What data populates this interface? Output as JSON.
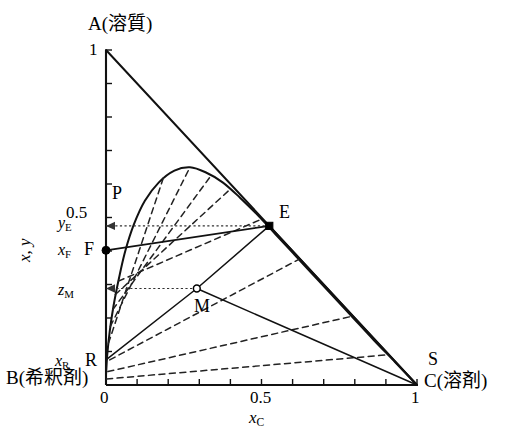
{
  "figure": {
    "kind": "ternary-phase-diagram",
    "vertices": {
      "top_label": "A(溶質)",
      "bottom_left_label": "B(希釈剤)",
      "bottom_right_label": "C(溶剤)",
      "bottom_right_upper_label": "S"
    },
    "axes": {
      "x_axis_label": "x",
      "x_axis_label_sub": "C",
      "y_axis_label": "x, y",
      "x_ticks": [
        {
          "value": 0,
          "label": "0"
        },
        {
          "value": 0.1,
          "label": ""
        },
        {
          "value": 0.2,
          "label": ""
        },
        {
          "value": 0.3,
          "label": ""
        },
        {
          "value": 0.4,
          "label": ""
        },
        {
          "value": 0.5,
          "label": "0.5"
        },
        {
          "value": 0.6,
          "label": ""
        },
        {
          "value": 0.7,
          "label": ""
        },
        {
          "value": 0.8,
          "label": ""
        },
        {
          "value": 0.9,
          "label": ""
        },
        {
          "value": 1.0,
          "label": "1"
        }
      ],
      "y_ticks": [
        {
          "value": 0,
          "label": "0"
        },
        {
          "value": 0.1,
          "label": ""
        },
        {
          "value": 0.2,
          "label": ""
        },
        {
          "value": 0.3,
          "label": ""
        },
        {
          "value": 0.4,
          "label": ""
        },
        {
          "value": 0.5,
          "label": "0.5"
        },
        {
          "value": 0.6,
          "label": ""
        },
        {
          "value": 0.7,
          "label": ""
        },
        {
          "value": 0.8,
          "label": ""
        },
        {
          "value": 0.9,
          "label": ""
        },
        {
          "value": 1.0,
          "label": "1"
        }
      ],
      "xlim": [
        0,
        1
      ],
      "ylim": [
        0,
        1
      ]
    },
    "point_labels": [
      {
        "id": "P",
        "label": "P"
      },
      {
        "id": "E",
        "label": "E"
      },
      {
        "id": "F",
        "label": "F"
      },
      {
        "id": "M",
        "label": "M"
      },
      {
        "id": "R",
        "label": "R"
      },
      {
        "id": "S",
        "label": "S"
      }
    ],
    "axis_value_labels": [
      {
        "id": "yE",
        "base": "y",
        "sub": "E"
      },
      {
        "id": "xF",
        "base": "x",
        "sub": "F"
      },
      {
        "id": "zM",
        "base": "z",
        "sub": "M"
      },
      {
        "id": "xR",
        "base": "x",
        "sub": "R"
      }
    ]
  },
  "chart_data": {
    "type": "line",
    "title": "",
    "xlabel": "xC",
    "ylabel": "x, y",
    "xlim": [
      0,
      1
    ],
    "ylim": [
      0,
      1
    ],
    "grid": false,
    "legend": "none",
    "series": [
      {
        "name": "hypotenuse-AC",
        "style": "solid",
        "points": [
          [
            0,
            1
          ],
          [
            1,
            0
          ]
        ]
      },
      {
        "name": "binodal-curve",
        "style": "solid",
        "points": [
          [
            0.0,
            0.03
          ],
          [
            0.004,
            0.09
          ],
          [
            0.012,
            0.16
          ],
          [
            0.024,
            0.235
          ],
          [
            0.042,
            0.32
          ],
          [
            0.062,
            0.4
          ],
          [
            0.09,
            0.48
          ],
          [
            0.125,
            0.55
          ],
          [
            0.17,
            0.605
          ],
          [
            0.22,
            0.64
          ],
          [
            0.27,
            0.65
          ],
          [
            0.32,
            0.635
          ],
          [
            0.375,
            0.605
          ],
          [
            0.43,
            0.56
          ],
          [
            0.49,
            0.505
          ],
          [
            0.545,
            0.45
          ],
          [
            0.6,
            0.395
          ],
          [
            0.66,
            0.335
          ],
          [
            0.72,
            0.275
          ],
          [
            0.79,
            0.205
          ],
          [
            0.86,
            0.135
          ],
          [
            0.93,
            0.068
          ],
          [
            1.0,
            0.0
          ]
        ]
      },
      {
        "name": "tie-line-1",
        "style": "dashed",
        "points": [
          [
            0.008,
            0.125
          ],
          [
            0.185,
            0.62
          ]
        ]
      },
      {
        "name": "tie-line-2",
        "style": "dashed",
        "points": [
          [
            0.014,
            0.175
          ],
          [
            0.27,
            0.65
          ]
        ]
      },
      {
        "name": "tie-line-3",
        "style": "dashed",
        "points": [
          [
            0.022,
            0.225
          ],
          [
            0.34,
            0.628
          ]
        ]
      },
      {
        "name": "tie-line-4",
        "style": "dashed",
        "points": [
          [
            0.03,
            0.27
          ],
          [
            0.4,
            0.585
          ]
        ]
      },
      {
        "name": "tie-line-5",
        "style": "dashed",
        "points": [
          [
            0.04,
            0.31
          ],
          [
            0.5,
            0.495
          ]
        ]
      },
      {
        "name": "tie-line-6",
        "style": "dashed",
        "points": [
          [
            0.012,
            0.075
          ],
          [
            0.62,
            0.375
          ]
        ]
      },
      {
        "name": "tie-line-7",
        "style": "dashed",
        "points": [
          [
            0.006,
            0.04
          ],
          [
            0.79,
            0.205
          ]
        ]
      },
      {
        "name": "tie-line-8",
        "style": "dashed",
        "points": [
          [
            0.002,
            0.018
          ],
          [
            0.905,
            0.09
          ]
        ]
      },
      {
        "name": "line-F-E-S",
        "style": "solid",
        "points": [
          [
            0.0,
            0.402
          ],
          [
            0.525,
            0.475
          ],
          [
            1.0,
            0.0
          ]
        ]
      },
      {
        "name": "line-R-M-E",
        "style": "solid",
        "points": [
          [
            0.0,
            0.075
          ],
          [
            0.292,
            0.288
          ],
          [
            0.525,
            0.475
          ]
        ]
      },
      {
        "name": "line-M-S",
        "style": "solid",
        "points": [
          [
            0.292,
            0.288
          ],
          [
            1.0,
            0.0
          ]
        ]
      },
      {
        "name": "arrow-E-to-yE",
        "style": "dotted-arrow",
        "points": [
          [
            0.525,
            0.475
          ],
          [
            0.0,
            0.475
          ]
        ]
      },
      {
        "name": "arrow-M-to-zM",
        "style": "dotted-arrow",
        "points": [
          [
            0.292,
            0.288
          ],
          [
            0.0,
            0.288
          ]
        ]
      }
    ],
    "annotations": [
      {
        "text": "A(溶質)",
        "x": 0.0,
        "y": 1.0,
        "placement": "above"
      },
      {
        "text": "B(希釈剤)",
        "x": 0.0,
        "y": 0.0,
        "placement": "left-below"
      },
      {
        "text": "C(溶剤)",
        "x": 1.0,
        "y": 0.0,
        "placement": "right"
      },
      {
        "text": "S",
        "x": 1.0,
        "y": 0.0,
        "placement": "right-above"
      },
      {
        "text": "P",
        "x": 0.03,
        "y": 0.545,
        "placement": "left"
      },
      {
        "text": "E",
        "x": 0.525,
        "y": 0.475,
        "placement": "right-above"
      },
      {
        "text": "F",
        "x": 0.0,
        "y": 0.402,
        "placement": "left"
      },
      {
        "text": "M",
        "x": 0.292,
        "y": 0.288,
        "placement": "below"
      },
      {
        "text": "R",
        "x": 0.0,
        "y": 0.075,
        "placement": "left"
      }
    ],
    "markers": [
      {
        "id": "F",
        "x": 0.0,
        "y": 0.402,
        "fill": "solid"
      },
      {
        "id": "E",
        "x": 0.525,
        "y": 0.475,
        "fill": "solid"
      },
      {
        "id": "M",
        "x": 0.292,
        "y": 0.288,
        "fill": "open"
      }
    ]
  },
  "text": {
    "A_vertex": "A(溶質)",
    "B_vertex": "B(希釈剤)",
    "C_vertex": "C(溶剤)",
    "S_point": "S",
    "P_point": "P",
    "E_point": "E",
    "F_point": "F",
    "M_point": "M",
    "R_point": "R",
    "tick_y_1": "1",
    "tick_y_05": "0.5",
    "tick_x_0": "0",
    "tick_x_05": "0.5",
    "tick_x_1": "1",
    "axis_y_title": "x, y",
    "axis_x_title_base": "x",
    "axis_x_title_sub": "C",
    "yE_base": "y",
    "yE_sub": "E",
    "xF_base": "x",
    "xF_sub": "F",
    "zM_base": "z",
    "zM_sub": "M",
    "xR_base": "x",
    "xR_sub": "R"
  }
}
